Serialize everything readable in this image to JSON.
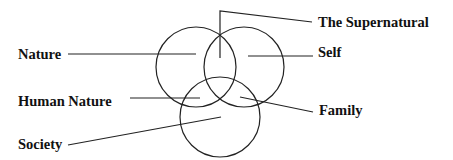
{
  "diagram": {
    "type": "venn",
    "circles": [
      {
        "id": "nature",
        "cx": 196,
        "cy": 67,
        "r": 40
      },
      {
        "id": "self",
        "cx": 244,
        "cy": 67,
        "r": 40
      },
      {
        "id": "society",
        "cx": 220,
        "cy": 117,
        "r": 40
      }
    ],
    "labels": {
      "supernatural": "The Supernatural",
      "nature": "Nature",
      "self": "Self",
      "human_nature": "Human Nature",
      "family": "Family",
      "society": "Society"
    }
  }
}
